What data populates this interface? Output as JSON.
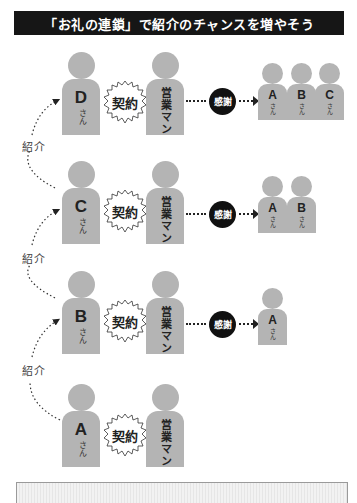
{
  "title": "「お礼の連鎖」で紹介のチャンスを増やそう",
  "labels": {
    "san": "さん",
    "salesman": "営業マン",
    "contract": "契約",
    "thanks": "感謝",
    "introduction": "紹介"
  },
  "rows": [
    {
      "customer": "D",
      "thanked": [
        "A",
        "B",
        "C"
      ]
    },
    {
      "customer": "C",
      "thanked": [
        "A",
        "B"
      ]
    },
    {
      "customer": "B",
      "thanked": [
        "A"
      ]
    },
    {
      "customer": "A",
      "thanked": []
    }
  ],
  "intro_labels": [
    "紹介",
    "紹介",
    "紹介"
  ],
  "colors": {
    "figure": "#b4b4b4",
    "header_bg": "#161616",
    "thanks_bg": "#111111"
  }
}
